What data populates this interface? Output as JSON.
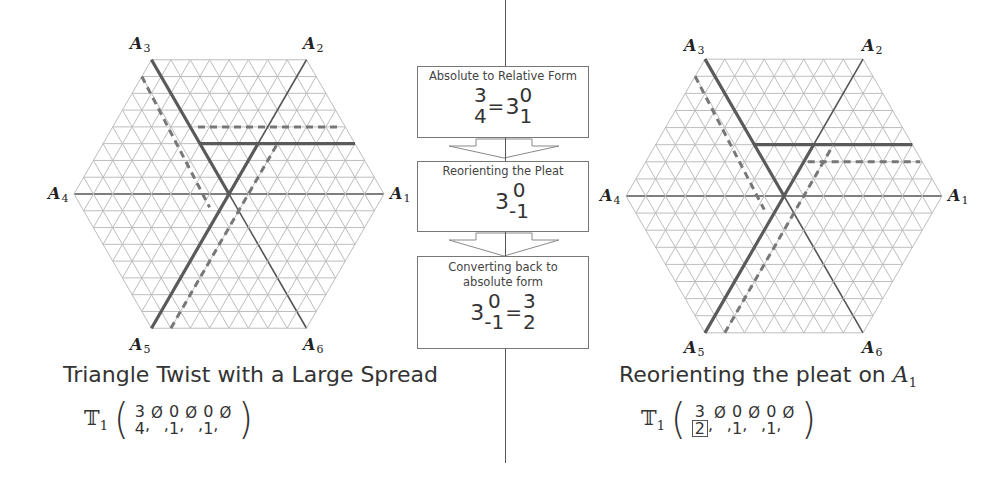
{
  "colors": {
    "grid": "#bdbdbd",
    "axis": "#555555",
    "thick": "#5a5a5a",
    "dashed": "#777777",
    "box_border": "#777777",
    "divider": "#555555"
  },
  "left_panel": {
    "hexagon": {
      "cx": 229,
      "cy": 194,
      "radius": 155,
      "subdivisions": 8
    },
    "axis_labels": [
      {
        "name": "A",
        "index": "1",
        "x": 390,
        "y": 186
      },
      {
        "name": "A",
        "index": "2",
        "x": 303,
        "y": 36
      },
      {
        "name": "A",
        "index": "3",
        "x": 130,
        "y": 36
      },
      {
        "name": "A",
        "index": "4",
        "x": 48,
        "y": 186
      },
      {
        "name": "A",
        "index": "5",
        "x": 130,
        "y": 337
      },
      {
        "name": "A",
        "index": "6",
        "x": 303,
        "y": 337
      }
    ],
    "thick_segments": [
      {
        "from": "A3",
        "to_rows": [
          0,
          0
        ]
      },
      {
        "pleat": "horizontal",
        "row": -3
      }
    ],
    "caption": "Triangle Twist with a Large Spread",
    "notation": {
      "symbol": "T",
      "subscript": "1",
      "terms": [
        {
          "top": "3",
          "bottom": "4",
          "boxed": false
        },
        {
          "empty": "Ø"
        },
        {
          "top": "0",
          "bottom": "1",
          "boxed": false
        },
        {
          "empty": "Ø"
        },
        {
          "top": "0",
          "bottom": "1",
          "boxed": false
        },
        {
          "empty": "Ø"
        }
      ]
    }
  },
  "right_panel": {
    "hexagon": {
      "cx": 784,
      "cy": 196,
      "radius": 158,
      "subdivisions": 8
    },
    "axis_labels": [
      {
        "name": "A",
        "index": "1",
        "x": 948,
        "y": 188
      },
      {
        "name": "A",
        "index": "2",
        "x": 862,
        "y": 38
      },
      {
        "name": "A",
        "index": "3",
        "x": 684,
        "y": 38
      },
      {
        "name": "A",
        "index": "4",
        "x": 600,
        "y": 188
      },
      {
        "name": "A",
        "index": "5",
        "x": 684,
        "y": 340
      },
      {
        "name": "A",
        "index": "6",
        "x": 862,
        "y": 340
      }
    ],
    "caption": "Reorienting the pleat on",
    "caption_axis": {
      "name": "A",
      "index": "1"
    },
    "notation": {
      "symbol": "T",
      "subscript": "1",
      "terms": [
        {
          "top": "3",
          "bottom": "2",
          "boxed": true
        },
        {
          "empty": "Ø"
        },
        {
          "top": "0",
          "bottom": "1",
          "boxed": false
        },
        {
          "empty": "Ø"
        },
        {
          "top": "0",
          "bottom": "1",
          "boxed": false
        },
        {
          "empty": "Ø"
        }
      ]
    }
  },
  "steps": [
    {
      "title": "Absolute to Relative Form",
      "lhs": {
        "top": "3",
        "bottom": "4"
      },
      "eq": "=",
      "rhs": {
        "base": "3",
        "sup": "0",
        "sub": "1"
      }
    },
    {
      "title": "Reorienting the Pleat",
      "rhs": {
        "base": "3",
        "sup": "0",
        "sub": "-1"
      }
    },
    {
      "title": "Converting back to absolute form",
      "lhs": {
        "base": "3",
        "sup": "0",
        "sub": "-1"
      },
      "eq": "=",
      "rhs": {
        "top": "3",
        "bottom": "2"
      }
    }
  ]
}
